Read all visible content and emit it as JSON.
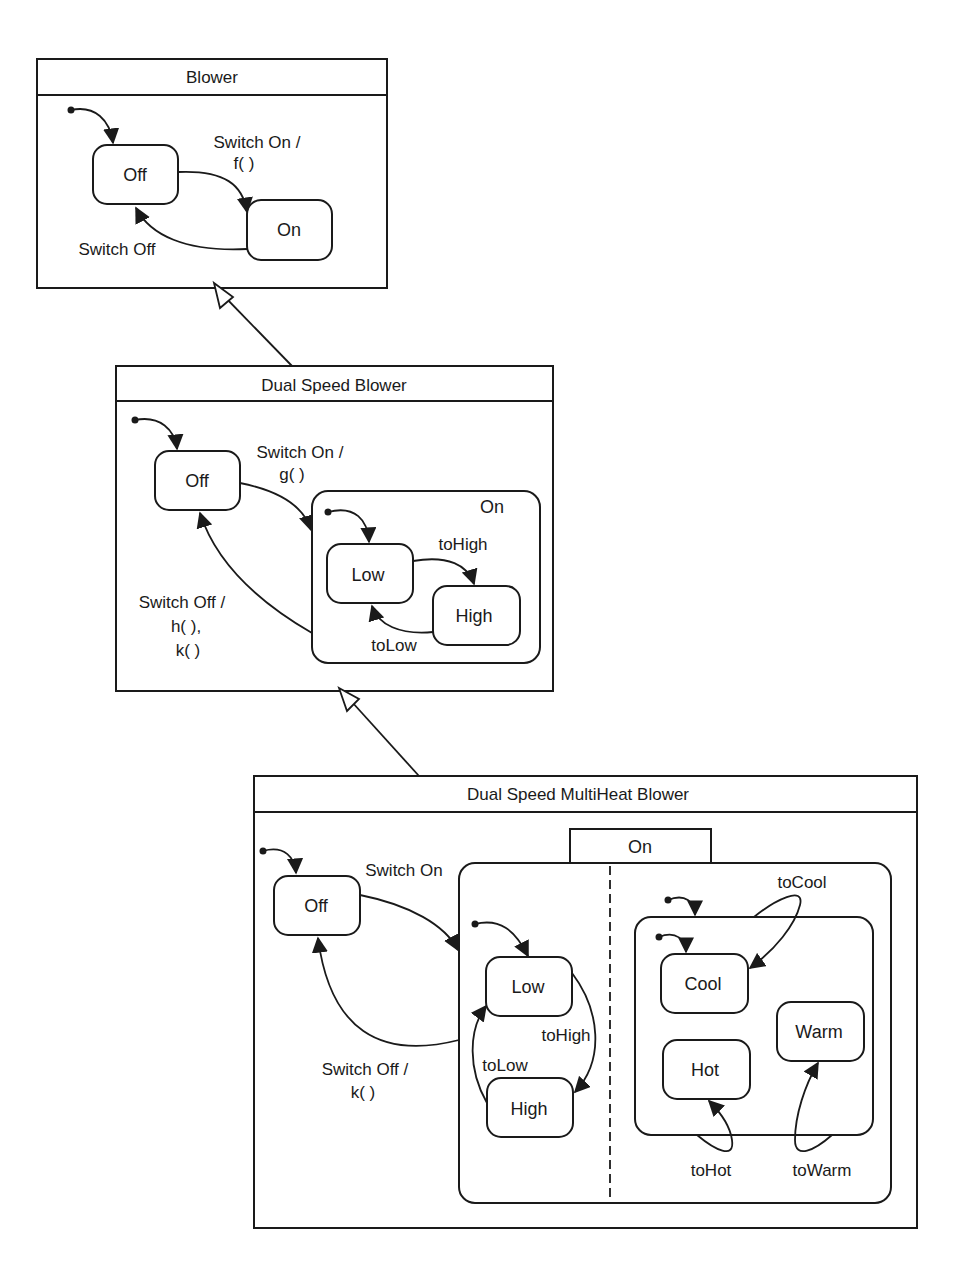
{
  "diagram": {
    "type": "UML state machine inheritance",
    "machines": [
      {
        "title": "Blower",
        "states": {
          "off": "Off",
          "on": "On"
        },
        "transitions": {
          "switch_on": [
            "Switch On /",
            "f( )"
          ],
          "switch_off": "Switch Off"
        }
      },
      {
        "title": "Dual Speed Blower",
        "states": {
          "off": "Off",
          "on": "On",
          "low": "Low",
          "high": "High"
        },
        "transitions": {
          "switch_on": [
            "Switch On /",
            "g( )"
          ],
          "switch_off": [
            "Switch Off /",
            "h( ),",
            "k( )"
          ],
          "to_high": "toHigh",
          "to_low": "toLow"
        }
      },
      {
        "title": "Dual Speed MultiHeat Blower",
        "states": {
          "off": "Off",
          "on": "On",
          "low": "Low",
          "high": "High",
          "cool": "Cool",
          "hot": "Hot",
          "warm": "Warm"
        },
        "transitions": {
          "switch_on": "Switch On",
          "switch_off": [
            "Switch Off /",
            "k( )"
          ],
          "to_high": "toHigh",
          "to_low": "toLow",
          "to_cool": "toCool",
          "to_hot": "toHot",
          "to_warm": "toWarm"
        }
      }
    ],
    "relations": [
      {
        "from": "Dual Speed Blower",
        "to": "Blower",
        "kind": "generalization"
      },
      {
        "from": "Dual Speed MultiHeat Blower",
        "to": "Dual Speed Blower",
        "kind": "generalization"
      }
    ]
  }
}
